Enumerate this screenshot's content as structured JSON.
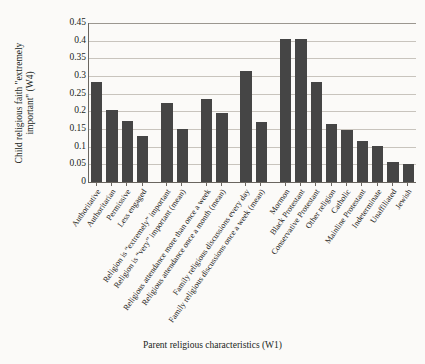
{
  "chart_data": {
    "type": "bar",
    "title": "",
    "xlabel": "Parent religious characteristics (W1)",
    "ylabel": "Child religious faith \"extremely important\" (W4)",
    "ylabel_line1": "Child religious faith \"extremely",
    "ylabel_line2": "important\" (W4)",
    "ylim": [
      0,
      0.45
    ],
    "yticks": [
      "0.45",
      "0.4",
      "0.35",
      "0.3",
      "0.25",
      "0.2",
      "0.15",
      "0.1",
      "0.05",
      "0"
    ],
    "ytick_values": [
      0.45,
      0.4,
      0.35,
      0.3,
      0.25,
      0.2,
      0.15,
      0.1,
      0.05,
      0
    ],
    "grid": true,
    "grid_axis": "y",
    "legend": "none",
    "bar_color": "#454545",
    "categories": [
      "Authoritative",
      "Authoritarian",
      "Permissive",
      "Less engaged",
      "Religion is “extremely” important",
      "Religion is “very” important (mean)",
      "Religious attendance more than once a week",
      "Religious attendance once a month (mean)",
      "Family religious discussions every day",
      "Family religious discussions once a week (mean)",
      "Mormon",
      "Black Protestant",
      "Conservative Protestant",
      "Other religion",
      "Catholic",
      "Mainline Protestant",
      "Indeterminate",
      "Unaffiliated",
      "Jewish"
    ],
    "values": [
      0.283,
      0.205,
      0.173,
      0.131,
      0.224,
      0.149,
      0.236,
      0.194,
      0.315,
      0.17,
      0.405,
      0.405,
      0.284,
      0.165,
      0.146,
      0.115,
      0.102,
      0.056,
      0.05
    ],
    "groups": [
      {
        "name": "parenting-style",
        "count": 4
      },
      {
        "name": "religion-importance",
        "count": 2
      },
      {
        "name": "religious-attendance",
        "count": 2
      },
      {
        "name": "family-religious-discussions",
        "count": 2
      },
      {
        "name": "denomination",
        "count": 9
      }
    ]
  }
}
